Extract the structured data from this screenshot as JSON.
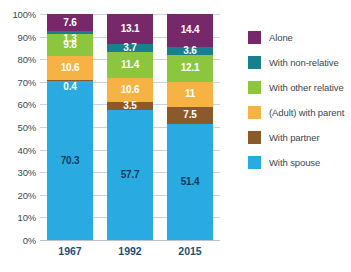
{
  "chart_data": {
    "type": "bar",
    "stacked": true,
    "title": "",
    "subtitle": "",
    "xlabel": "",
    "ylabel": "",
    "categories": [
      "1967",
      "1992",
      "2015"
    ],
    "ylim": [
      0,
      100
    ],
    "ytick_labels": [
      "100%",
      "90%",
      "80%",
      "70%",
      "60%",
      "50%",
      "40%",
      "30%",
      "20%",
      "10%",
      "0%"
    ],
    "ytick_values": [
      100,
      90,
      80,
      70,
      60,
      50,
      40,
      30,
      20,
      10,
      0
    ],
    "grid": true,
    "legend_position": "right",
    "stack_order_top_to_bottom": [
      "Alone",
      "With non-relative",
      "With other relative",
      "(Adult) with parent",
      "With partner",
      "With spouse"
    ],
    "series": [
      {
        "name": "Alone",
        "color": "#76286A",
        "values": [
          7.6,
          13.1,
          14.4
        ],
        "labels": [
          "7.6",
          "13.1",
          "14.4"
        ]
      },
      {
        "name": "With non-relative",
        "color": "#17808C",
        "values": [
          1.3,
          3.7,
          3.6
        ],
        "labels": [
          "1.3",
          "3.7",
          "3.6"
        ]
      },
      {
        "name": "With other relative",
        "color": "#8CC63F",
        "values": [
          9.8,
          11.4,
          12.1
        ],
        "labels": [
          "9.8",
          "11.4",
          "12.1"
        ]
      },
      {
        "name": "(Adult) with parent",
        "color": "#F6B343",
        "values": [
          10.6,
          10.6,
          11
        ],
        "labels": [
          "10.6",
          "10.6",
          "11"
        ]
      },
      {
        "name": "With partner",
        "color": "#8B5A2B",
        "values": [
          0.4,
          3.5,
          7.5
        ],
        "labels": [
          "0.4",
          "3.5",
          "7.5"
        ]
      },
      {
        "name": "With spouse",
        "color": "#29ABE2",
        "values": [
          70.3,
          57.7,
          51.4
        ],
        "labels": [
          "70.3",
          "57.7",
          "51.4"
        ]
      }
    ]
  },
  "legend": {
    "items": [
      {
        "label": "Alone",
        "color": "#76286A"
      },
      {
        "label": "With non-relative",
        "color": "#17808C"
      },
      {
        "label": "With other relative",
        "color": "#8CC63F"
      },
      {
        "label": "(Adult) with parent",
        "color": "#F6B343"
      },
      {
        "label": "With partner",
        "color": "#8B5A2B"
      },
      {
        "label": "With spouse",
        "color": "#29ABE2"
      }
    ]
  },
  "colors": {
    "gridline": "#c9d2da",
    "axis_text": "#3d4a57",
    "category_text": "#1f4f78",
    "background": "#ffffff"
  }
}
